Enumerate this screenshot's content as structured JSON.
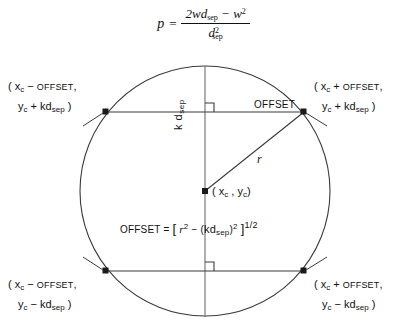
{
  "figure": {
    "type": "geometric-diagram",
    "background_color": "#ffffff",
    "stroke_color": "#333333"
  },
  "top_formula": {
    "lhs": "p",
    "equals": "=",
    "numerator_prefix": "2wd",
    "numerator_sub": "sep",
    "numerator_minus": "−",
    "numerator_w": "w",
    "numerator_w_exp": "2",
    "denominator_base": "d",
    "denominator_sub": "sep",
    "denominator_exp": "2",
    "plain_text": "p = (2wd_sep − w^2) / d_sep^2"
  },
  "corner_labels": {
    "top_left": {
      "line1_open": "( x",
      "line1_sub": "c",
      "line1_op": "−",
      "line1_term": "OFFSET",
      "line1_comma": ",",
      "line2_var": "y",
      "line2_sub": "c",
      "line2_op": "+",
      "line2_term": "kd",
      "line2_term_sub": "sep",
      "line2_close": ")",
      "plain_text": "( x_c − OFFSET , y_c + kd_sep )"
    },
    "top_right": {
      "line1_open": "( x",
      "line1_sub": "c",
      "line1_op": "+",
      "line1_term": "OFFSET",
      "line1_comma": ",",
      "line2_var": "y",
      "line2_sub": "c",
      "line2_op": "+",
      "line2_term": "kd",
      "line2_term_sub": "sep",
      "line2_close": ")",
      "plain_text": "( x_c + OFFSET , y_c + kd_sep )"
    },
    "bottom_left": {
      "line1_open": "( x",
      "line1_sub": "c",
      "line1_op": "−",
      "line1_term": "OFFSET",
      "line1_comma": ",",
      "line2_var": "y",
      "line2_sub": "c",
      "line2_op": "−",
      "line2_term": "kd",
      "line2_term_sub": "sep",
      "line2_close": ")",
      "plain_text": "( x_c − OFFSET , y_c − kd_sep )"
    },
    "bottom_right": {
      "line1_open": "( x",
      "line1_sub": "c",
      "line1_op": "+",
      "line1_term": "OFFSET",
      "line1_comma": ",",
      "line2_var": "y",
      "line2_sub": "c",
      "line2_op": "−",
      "line2_term": "kd",
      "line2_term_sub": "sep",
      "line2_close": ")",
      "plain_text": "( x_c + OFFSET , y_c − kd_sep )"
    }
  },
  "inline_labels": {
    "offset_segment": "OFFSET",
    "radius": "r",
    "center_point": {
      "open": "( x",
      "sub1": "c",
      "comma": ",",
      "var2": "y",
      "sub2": "c",
      "close": ")",
      "plain_text": "( x_c , y_c )"
    },
    "vertical_distance": {
      "k": "k d",
      "sub": "sep",
      "plain_text": "k d_sep"
    },
    "offset_equation": {
      "lhs": "OFFSET",
      "equals": "=",
      "open_bracket": "[",
      "r": "r",
      "r_exp": "2",
      "minus": "−",
      "paren_open": "(",
      "kd": "kd",
      "kd_sub": "sep",
      "paren_close": ")",
      "kd_exp": "2",
      "close_bracket": "]",
      "power": "1/2",
      "plain_text": "OFFSET = [ r^2 − (kd_sep)^2 ]^(1/2)"
    }
  },
  "geometry": {
    "center": {
      "x": 205,
      "y": 191
    },
    "radius": 125,
    "upper_chord_y": 112,
    "lower_chord_y": 271,
    "upper_chord_left_x": 106,
    "upper_chord_right_x": 304,
    "lower_chord_left_x": 106,
    "lower_chord_right_x": 304,
    "right_angle_marker_size": 9,
    "vertices": [
      {
        "name": "top-left-point",
        "x": 106,
        "y": 112
      },
      {
        "name": "top-right-point",
        "x": 304,
        "y": 112
      },
      {
        "name": "bottom-left-point",
        "x": 106,
        "y": 271
      },
      {
        "name": "bottom-right-point",
        "x": 304,
        "y": 271
      }
    ]
  }
}
